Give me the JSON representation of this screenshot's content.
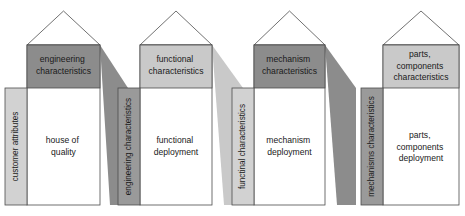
{
  "diagram": {
    "type": "process-cascade",
    "colors": {
      "dark_gray": "#8c8c8c",
      "light_gray": "#c9c9c9",
      "sidebar_light": "#d2d2d2",
      "sidebar_dark": "#9a9a9a",
      "outline": "#4d4d4d",
      "body_fill": "#ffffff",
      "text": "#1a1a1a",
      "background": "#ffffff"
    },
    "houses": [
      {
        "id": "house-1",
        "sidebar_label": "customer attributes",
        "sidebar_shade": "light",
        "header_label": "engineering\ncharacteristics",
        "header_lines": [
          "engineering",
          "characteristics"
        ],
        "header_shade": "dark",
        "body_label": "house of\nquality",
        "body_lines": [
          "house of",
          "quality"
        ]
      },
      {
        "id": "house-2",
        "sidebar_label": "engineering characteristics",
        "sidebar_shade": "dark",
        "header_label": "functional\ncharacteristics",
        "header_lines": [
          "functional",
          "characteristics"
        ],
        "header_shade": "light",
        "body_label": "functional\ndeployment",
        "body_lines": [
          "functional",
          "deployment"
        ]
      },
      {
        "id": "house-3",
        "sidebar_label": "functinal characteristics",
        "sidebar_shade": "light",
        "header_label": "mechanism\ncharacteristics",
        "header_lines": [
          "mechanism",
          "characteristics"
        ],
        "header_shade": "dark",
        "body_label": "mechanism\ndeployment",
        "body_lines": [
          "mechanism",
          "deployment"
        ]
      },
      {
        "id": "house-4",
        "sidebar_label": "mechanisms characteristics",
        "sidebar_shade": "dark",
        "header_label": "parts,\ncomponents\ncharacteristics",
        "header_lines": [
          "parts,",
          "components",
          "characteristics"
        ],
        "header_shade": "light",
        "body_label": "parts,\ncomponents\ndeployment",
        "body_lines": [
          "parts,",
          "components",
          "deployment"
        ]
      }
    ],
    "connectors": [
      {
        "id": "connector-1-2",
        "from": "house-1",
        "to": "house-2",
        "shade": "dark"
      },
      {
        "id": "connector-2-3",
        "from": "house-2",
        "to": "house-3",
        "shade": "light"
      },
      {
        "id": "connector-3-4",
        "from": "house-3",
        "to": "house-4",
        "shade": "dark"
      }
    ]
  }
}
